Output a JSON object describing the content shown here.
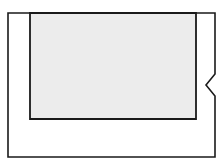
{
  "figure": {
    "type": "line-drawing",
    "title": "Nested rectangles line drawing with notched right edge",
    "canvas": {
      "width": 223,
      "height": 166,
      "background": "#ffffff"
    },
    "colors": {
      "stroke": "#1a1a1a",
      "inner_fill": "#ececec",
      "outer_fill": "#ffffff"
    },
    "shapes": [
      {
        "name": "outer-frame",
        "label": "Outer frame",
        "kind": "polygon-with-notch",
        "fill": "#ffffff",
        "stroke": "#1a1a1a",
        "stroke_width": 1.6,
        "bounds": {
          "x": 8,
          "y": 13,
          "width": 207,
          "height": 144
        },
        "notch": {
          "edge": "right",
          "direction": "inward",
          "start_y": 74,
          "apex_y": 85,
          "end_y": 96,
          "depth": 9
        },
        "points": "8,13 215,13 215,74 206,85 215,96 215,157 8,157"
      },
      {
        "name": "inner-panel",
        "label": "Inner panel",
        "kind": "rectangle",
        "fill": "#ececec",
        "stroke": "#1a1a1a",
        "stroke_width": 1.8,
        "bounds": {
          "x": 30,
          "y": 13,
          "width": 166,
          "height": 106
        },
        "points": "30,13 196,13 196,119 30,119"
      }
    ]
  }
}
